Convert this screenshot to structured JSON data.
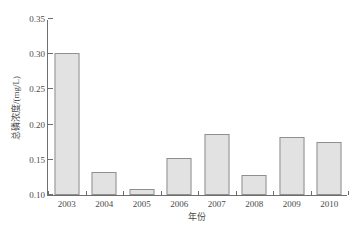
{
  "chart_data": {
    "type": "bar",
    "title": "",
    "categories": [
      "2003",
      "2004",
      "2005",
      "2006",
      "2007",
      "2008",
      "2009",
      "2010"
    ],
    "values": [
      0.302,
      0.133,
      0.109,
      0.152,
      0.187,
      0.129,
      0.182,
      0.175
    ],
    "series": [
      {
        "name": "总磷浓度",
        "values": [
          0.302,
          0.133,
          0.109,
          0.152,
          0.187,
          0.129,
          0.182,
          0.175
        ]
      }
    ],
    "xlabel": "年份",
    "ylabel": "总磷浓度/(mg/L)",
    "ylim": [
      0.1,
      0.35
    ],
    "yticks": [
      "0.10",
      "0.15",
      "0.20",
      "0.25",
      "0.30",
      "0.35"
    ],
    "ytick_values": [
      0.1,
      0.15,
      0.2,
      0.25,
      0.3,
      0.35
    ],
    "grid": false,
    "legend": "none",
    "bar_color": "#e2e2e2",
    "bar_edge_color": "#8f8f8f",
    "axis_color": "#6e6e6e",
    "text_color": "#4a4a4a"
  },
  "caption": ""
}
